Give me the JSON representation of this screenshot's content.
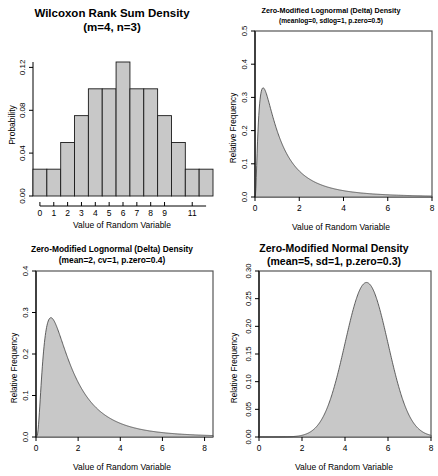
{
  "figure": {
    "background": "#ffffff",
    "fill_color": "#c8c8c8",
    "line_color": "#3c3c3c",
    "axis_color": "#000000",
    "panels": 4,
    "layout": "2x2"
  },
  "chart_data": [
    {
      "id": "wilcoxon-rank-sum-density",
      "type": "bar",
      "title": "Wilcoxon Rank Sum Density",
      "subtitle": "(m=4, n=3)",
      "xlabel": "Value of Random Variable",
      "ylabel": "Probability",
      "categories": [
        0,
        1,
        2,
        3,
        4,
        5,
        6,
        7,
        8,
        9,
        10,
        11,
        12
      ],
      "values": [
        0.0286,
        0.0286,
        0.0571,
        0.0857,
        0.1143,
        0.1143,
        0.1429,
        0.1143,
        0.1143,
        0.0857,
        0.0571,
        0.0286,
        0.0286
      ],
      "xlim": [
        -0.5,
        12.5
      ],
      "ylim": [
        0,
        0.1429
      ],
      "xticks": [
        0,
        1,
        2,
        3,
        4,
        5,
        6,
        7,
        8,
        9,
        11
      ],
      "xticklabels": [
        "0",
        "1",
        "2",
        "3",
        "4",
        "5",
        "6",
        "7",
        "8",
        "9",
        "11"
      ],
      "yticks": [
        0.0,
        0.04,
        0.08,
        0.12
      ],
      "yticklabels": [
        "0.00",
        "0.04",
        "0.08",
        "0.12"
      ],
      "grid": false,
      "legend": false,
      "box": false
    },
    {
      "id": "zero-modified-lognormal-delta-density-meanlog",
      "type": "area",
      "title": "Zero-Modified Lognormal (Delta) Density",
      "subtitle": "(meanlog=0, sdlog=1, p.zero=0.5)",
      "xlabel": "Value of Random Variable",
      "ylabel": "Relative Frequency",
      "xlim": [
        0,
        8
      ],
      "ylim": [
        0,
        0.5
      ],
      "xticks": [
        0,
        2,
        4,
        6,
        8
      ],
      "xticklabels": [
        "0",
        "2",
        "4",
        "6",
        "8"
      ],
      "yticks": [
        0.0,
        0.1,
        0.2,
        0.3,
        0.4,
        0.5
      ],
      "yticklabels": [
        "0.0",
        "0.1",
        "0.2",
        "0.3",
        "0.4",
        "0.5"
      ],
      "spike": {
        "x": 0,
        "height": 0.5
      },
      "peak": {
        "x": 0.4,
        "y": 0.33
      },
      "grid": false,
      "legend": false,
      "box": true,
      "params": {
        "meanlog": 0,
        "sdlog": 1,
        "p.zero": 0.5
      }
    },
    {
      "id": "zero-modified-lognormal-delta-density-mean-cv",
      "type": "area",
      "title": "Zero-Modified Lognormal (Delta) Density",
      "subtitle": "(mean=2, cv=1, p.zero=0.4)",
      "xlabel": "Value of Random Variable",
      "ylabel": "Relative Frequency",
      "xlim": [
        0,
        8.4
      ],
      "ylim": [
        0,
        0.4
      ],
      "xticks": [
        0,
        2,
        4,
        6,
        8
      ],
      "xticklabels": [
        "0",
        "2",
        "4",
        "6",
        "8"
      ],
      "yticks": [
        0.0,
        0.1,
        0.2,
        0.3,
        0.4
      ],
      "yticklabels": [
        "0.0",
        "0.1",
        "0.2",
        "0.3",
        "0.4"
      ],
      "spike": {
        "x": 0,
        "height": 0.4
      },
      "peak": {
        "x": 0.8,
        "y": 0.29
      },
      "grid": false,
      "legend": false,
      "box": true,
      "params": {
        "mean": 2,
        "cv": 1,
        "p.zero": 0.4
      }
    },
    {
      "id": "zero-modified-normal-density",
      "type": "area",
      "title": "Zero-Modified Normal Density",
      "subtitle": "(mean=5, sd=1, p.zero=0.3)",
      "xlabel": "Value of Random Variable",
      "ylabel": "Relative Frequency",
      "xlim": [
        0,
        8
      ],
      "ylim": [
        0,
        0.3
      ],
      "xticks": [
        0,
        2,
        4,
        6,
        8
      ],
      "xticklabels": [
        "0",
        "2",
        "4",
        "6",
        "8"
      ],
      "yticks": [
        0.0,
        0.05,
        0.1,
        0.15,
        0.2,
        0.25,
        0.3
      ],
      "yticklabels": [
        "0.00",
        "0.05",
        "0.10",
        "0.15",
        "0.20",
        "0.25",
        "0.30"
      ],
      "spike": {
        "x": 0,
        "height": 0.3
      },
      "peak": {
        "x": 5,
        "y": 0.283
      },
      "grid": false,
      "legend": false,
      "box": true,
      "params": {
        "mean": 5,
        "sd": 1,
        "p.zero": 0.3
      }
    }
  ]
}
